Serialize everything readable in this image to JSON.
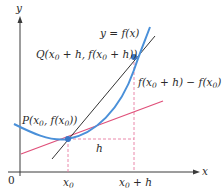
{
  "figure": {
    "type": "secant-line-diagram",
    "colors": {
      "axis": "#3a3a3a",
      "curve": "#4a90d9",
      "secant": "#333333",
      "tangent": "#e0507a",
      "dashed": "#e87aa0",
      "point": "#3a78c8"
    },
    "axes": {
      "x_label": "x",
      "y_label": "y",
      "origin_label": "0"
    },
    "ticks": {
      "x0_label": "x",
      "x0_sub": "0",
      "x0h_label": "x",
      "x0h_sub": "0",
      "x0h_suffix": " + h"
    },
    "labels": {
      "curve_eq": "y = f(x)",
      "point_q_prefix": "Q(x",
      "point_q_sub": "0",
      "point_q_mid": " + h, f(x",
      "point_q_sub2": "0",
      "point_q_suffix": " + h))",
      "point_p_prefix": "P(x",
      "point_p_sub": "0",
      "point_p_mid": ", f(x",
      "point_p_sub2": "0",
      "point_p_suffix": "))",
      "rise_prefix": "f(x",
      "rise_sub": "0",
      "rise_mid": " + h) − f(x",
      "rise_sub2": "0",
      "rise_suffix": ")",
      "run": "h"
    },
    "points": {
      "P": {
        "x": 68,
        "y": 139
      },
      "Q": {
        "x": 145,
        "y": 57
      }
    }
  }
}
